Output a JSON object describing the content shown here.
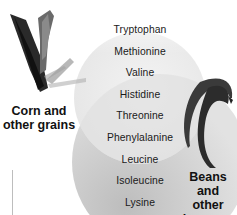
{
  "diagram": {
    "type": "venn",
    "sets": [
      {
        "id": "grains",
        "label_line1": "Corn and",
        "label_line2": "other grains",
        "icon": "corn-icon"
      },
      {
        "id": "legumes",
        "label_line1": "Beans and",
        "label_line2": "other",
        "label_line3": "legumes",
        "icon": "bean-pods-icon"
      }
    ],
    "amino_acids": [
      "Tryptophan",
      "Methionine",
      "Valine",
      "Histidine",
      "Threonine",
      "Phenylalanine",
      "Leucine",
      "Isoleucine",
      "Lysine"
    ],
    "colors": {
      "grains_circle": "#ededed",
      "legumes_circle": "#c9c9c9",
      "overlap": "#e4e4e4",
      "text": "#1a1a1a"
    }
  }
}
